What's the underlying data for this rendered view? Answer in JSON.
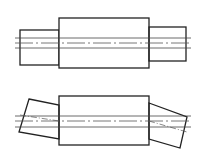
{
  "diagram": {
    "stroke_color": "#222222",
    "centerline_color": "#555555",
    "top_view": {
      "left_journal": {
        "x": 20,
        "y": 30,
        "w": 39,
        "h": 35
      },
      "center_body": {
        "x": 59,
        "y": 18,
        "w": 90,
        "h": 50
      },
      "right_journal": {
        "x": 149,
        "y": 27,
        "w": 37,
        "h": 34
      },
      "lines": {
        "x1": 15,
        "x2": 191,
        "upper_y": 38,
        "center_y": 43,
        "lower_y": 48
      }
    },
    "bottom_view": {
      "left_journal_points": "29,99 59,105 59,139 19,132",
      "center_body": {
        "x": 59,
        "y": 96,
        "w": 90,
        "h": 49
      },
      "right_journal_points": "149,103 187,117 180,148 149,139",
      "lines": {
        "x1": 15,
        "x2": 191,
        "upper_y": 116,
        "center_y": 121,
        "lower_y": 127
      }
    }
  }
}
